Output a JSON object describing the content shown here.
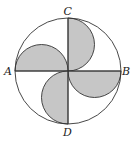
{
  "diagram": {
    "type": "geometry",
    "colors": {
      "stroke": "#333333",
      "fill": "#c6c6c6",
      "background": "#ffffff"
    },
    "circle": {
      "cx": 68,
      "cy": 71,
      "r": 53
    },
    "labels": {
      "A": "A",
      "B": "B",
      "C": "C",
      "D": "D"
    },
    "points": {
      "A": {
        "x": 15,
        "y": 71
      },
      "B": {
        "x": 121,
        "y": 71
      },
      "C": {
        "x": 68,
        "y": 18
      },
      "D": {
        "x": 68,
        "y": 124
      }
    },
    "shaded_semicircles": [
      {
        "on": "OC",
        "bulge": "right"
      },
      {
        "on": "AO",
        "bulge": "up"
      },
      {
        "on": "OB",
        "bulge": "down"
      },
      {
        "on": "OD",
        "bulge": "left"
      }
    ]
  }
}
